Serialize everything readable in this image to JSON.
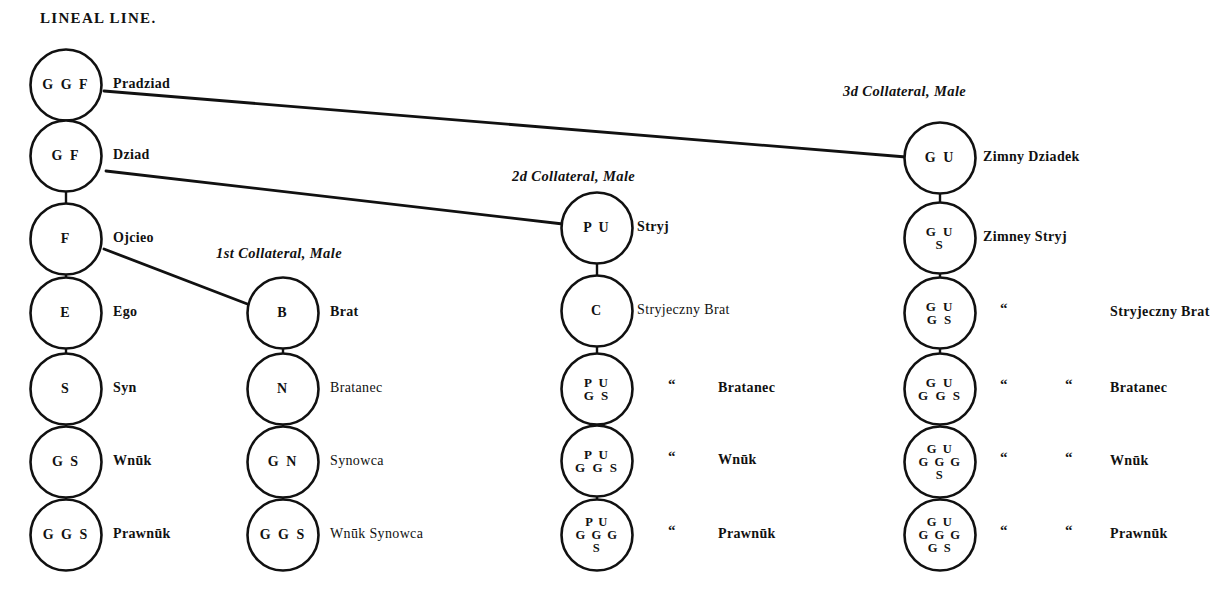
{
  "title": "LINEAL LINE.",
  "headers": {
    "col2": "1st Collateral, Male",
    "col3": "2d Collateral, Male",
    "col4": "3d Collateral, Male"
  },
  "ditto_mark": "“",
  "columns": [
    {
      "name": "lineal-line",
      "nodes": [
        {
          "code": "G G F",
          "lines": [
            "G G F"
          ],
          "label": "Pradziad",
          "bold": true,
          "ditto": []
        },
        {
          "code": "G F",
          "lines": [
            "G F"
          ],
          "label": "Dziad",
          "bold": true,
          "ditto": []
        },
        {
          "code": "F",
          "lines": [
            "F"
          ],
          "label": "Ojcieo",
          "bold": true,
          "ditto": []
        },
        {
          "code": "E",
          "lines": [
            "E"
          ],
          "label": "Ego",
          "bold": true,
          "ditto": []
        },
        {
          "code": "S",
          "lines": [
            "S"
          ],
          "label": "Syn",
          "bold": true,
          "ditto": []
        },
        {
          "code": "G S",
          "lines": [
            "G S"
          ],
          "label": "Wnūk",
          "bold": true,
          "ditto": []
        },
        {
          "code": "G G S",
          "lines": [
            "G G S"
          ],
          "label": "Prawnūk",
          "bold": true,
          "ditto": []
        }
      ]
    },
    {
      "name": "first-collateral-male",
      "nodes": [
        {
          "code": "B",
          "lines": [
            "B"
          ],
          "label": "Brat",
          "bold": true,
          "ditto": []
        },
        {
          "code": "N",
          "lines": [
            "N"
          ],
          "label": "Bratanec",
          "bold": false,
          "ditto": []
        },
        {
          "code": "G N",
          "lines": [
            "G N"
          ],
          "label": "Synowca",
          "bold": false,
          "ditto": []
        },
        {
          "code": "G G S",
          "lines": [
            "G G S"
          ],
          "label": "Wnūk Synowca",
          "bold": false,
          "ditto": []
        }
      ]
    },
    {
      "name": "second-collateral-male",
      "nodes": [
        {
          "code": "P U",
          "lines": [
            "P U"
          ],
          "label": "Stryj",
          "bold": true,
          "ditto": []
        },
        {
          "code": "C",
          "lines": [
            "C"
          ],
          "label": "Stryjeczny Brat",
          "bold": false,
          "ditto": []
        },
        {
          "code": "P U G S",
          "lines": [
            "P U",
            "G S"
          ],
          "label": "Bratanec",
          "bold": true,
          "ditto": [
            "“"
          ]
        },
        {
          "code": "P U G G S",
          "lines": [
            "P U",
            "G G S"
          ],
          "label": "Wnūk",
          "bold": true,
          "ditto": [
            "“"
          ]
        },
        {
          "code": "P U G G G S",
          "lines": [
            "P U",
            "G G G",
            "S"
          ],
          "label": "Prawnūk",
          "bold": true,
          "ditto": [
            "“"
          ]
        }
      ]
    },
    {
      "name": "third-collateral-male",
      "nodes": [
        {
          "code": "G U",
          "lines": [
            "G U"
          ],
          "label": "Zimny Dziadek",
          "bold": true,
          "ditto": []
        },
        {
          "code": "G U S",
          "lines": [
            "G U",
            "S"
          ],
          "label": "Zimney Stryj",
          "bold": true,
          "ditto": []
        },
        {
          "code": "G U G S",
          "lines": [
            "G U",
            "G S"
          ],
          "label": "Stryjeczny Brat",
          "bold": true,
          "ditto": [
            "“"
          ]
        },
        {
          "code": "G U G G S",
          "lines": [
            "G U",
            "G G S"
          ],
          "label": "Bratanec",
          "bold": true,
          "ditto": [
            "“",
            "“"
          ]
        },
        {
          "code": "G U G G G S",
          "lines": [
            "G U",
            "G G G",
            "S"
          ],
          "label": "Wnūk",
          "bold": true,
          "ditto": [
            "“",
            "“"
          ]
        },
        {
          "code": "G U G G G G S",
          "lines": [
            "G U",
            "G G G",
            "G S"
          ],
          "label": "Prawnūk",
          "bold": true,
          "ditto": [
            "“",
            "“"
          ]
        }
      ]
    }
  ],
  "colors": {
    "ink": "#111111",
    "paper": "#ffffff"
  }
}
